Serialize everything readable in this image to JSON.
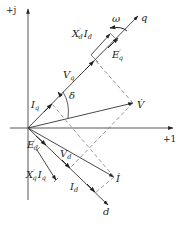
{
  "diagram": {
    "type": "phasor-diagram",
    "axes": {
      "imag_label": "+j",
      "real_label": "+1",
      "q_label": "q",
      "d_label": "d"
    },
    "labels": {
      "omega": "ω",
      "Xd_prime": "X",
      "Xd_prime_sup": "′",
      "Xd_prime_sub": "d",
      "Id_main": "I",
      "Id_main_sub": "d",
      "Eq_prime": "E",
      "Eq_prime_sup": "′",
      "Eq_prime_sub": "q",
      "Vq": "V",
      "Vq_sub": "q",
      "Iq": "I",
      "Iq_sub": "q",
      "delta": "δ",
      "V": "V̇",
      "Ed_prime": "E",
      "Ed_prime_sup": "′",
      "Ed_prime_sub": "d",
      "Vd": "V",
      "Vd_sub": "d",
      "Xq_prime": "X",
      "Xq_prime_sup": "′",
      "Xq_prime_sub": "q",
      "Iq_lower": "I",
      "Iq_lower_sub": "q",
      "I": "İ",
      "Id": "I",
      "Id_sub": "d"
    },
    "colors": {
      "line": "#333333",
      "dashed": "#777777",
      "background": "#ffffff"
    }
  }
}
